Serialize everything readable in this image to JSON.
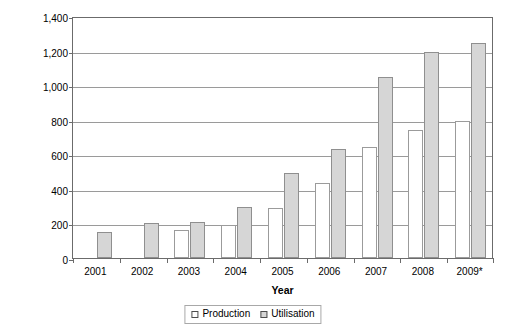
{
  "chart_data": {
    "type": "bar",
    "title": "",
    "subtitle": "",
    "xlabel": "Year",
    "ylabel": "[1,000 t (w.b.)/a]",
    "categories": [
      "2001",
      "2002",
      "2003",
      "2004",
      "2005",
      "2006",
      "2007",
      "2008",
      "2009*"
    ],
    "series": [
      {
        "name": "Production",
        "color": "#ffffff",
        "values": [
          0,
          0,
          160,
          190,
          290,
          435,
          645,
          740,
          790
        ]
      },
      {
        "name": "Utilisation",
        "color": "#d6d6d6",
        "values": [
          150,
          205,
          210,
          295,
          490,
          630,
          1045,
          1190,
          1245
        ]
      }
    ],
    "ylim": [
      0,
      1400
    ],
    "ytick_step": 200,
    "ytick_labels": [
      "0",
      "200",
      "400",
      "600",
      "800",
      "1,000",
      "1,200",
      "1,400"
    ],
    "ytick_values": [
      0,
      200,
      400,
      600,
      800,
      1000,
      1200,
      1400
    ],
    "grid": true,
    "grid_axis": "y",
    "legend_position": "bottom",
    "legend_entries": [
      "Production",
      "Utilisation"
    ],
    "footnote": "*"
  },
  "axes": {
    "y_title": "[1,000 t (w.b.)/a]",
    "x_title": "Year"
  },
  "legend": {
    "items": [
      {
        "label": "Production",
        "swatch": "production"
      },
      {
        "label": "Utilisation",
        "swatch": "utilisation"
      }
    ]
  }
}
